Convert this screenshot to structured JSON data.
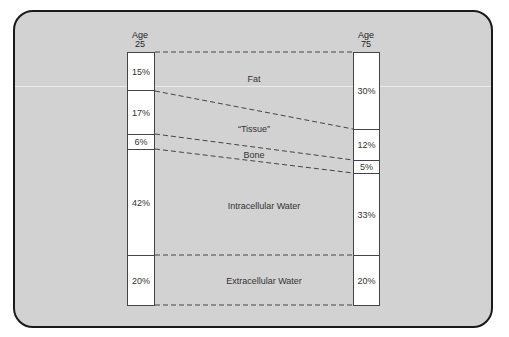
{
  "diagram": {
    "left_column": {
      "header_line1": "Age",
      "header_line2": "25",
      "segments": [
        {
          "component": "Fat",
          "value": "15%"
        },
        {
          "component": "Tissue",
          "value": "17%"
        },
        {
          "component": "Bone",
          "value": "6%"
        },
        {
          "component": "Intracellular Water",
          "value": "42%"
        },
        {
          "component": "Extracellular Water",
          "value": "20%"
        }
      ]
    },
    "right_column": {
      "header_line1": "Age",
      "header_line2": "75",
      "segments": [
        {
          "component": "Fat",
          "value": "30%"
        },
        {
          "component": "Tissue",
          "value": "12%"
        },
        {
          "component": "Bone",
          "value": "5%"
        },
        {
          "component": "Intracellular Water",
          "value": "33%"
        },
        {
          "component": "Extracellular Water",
          "value": "20%"
        }
      ]
    },
    "region_labels": {
      "fat": "Fat",
      "tissue": "“Tissue”",
      "bone": "Bone",
      "intracellular": "Intracellular Water",
      "extracellular": "Extracellular Water"
    },
    "colors": {
      "background": "#d2d2d2",
      "bar_fill": "#ffffff",
      "lines": "#444444"
    }
  }
}
